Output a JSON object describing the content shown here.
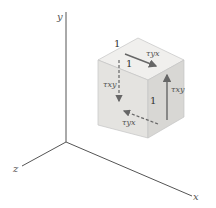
{
  "diagram": {
    "axes": {
      "x_label": "x",
      "y_label": "y",
      "z_label": "z"
    },
    "cube": {
      "edge_labels": [
        "1",
        "1",
        "1"
      ],
      "face_colors": {
        "top": "#f0efed",
        "front": "#e3e2df",
        "right": "#d9d8d5"
      }
    },
    "stresses": {
      "top_face": "τyx",
      "front_face": "τxy",
      "right_face": "τxy",
      "bottom_hidden": "τyx"
    },
    "colors": {
      "axis": "#555555",
      "arrow": "#666666",
      "edge": "#b8b8b8"
    }
  }
}
